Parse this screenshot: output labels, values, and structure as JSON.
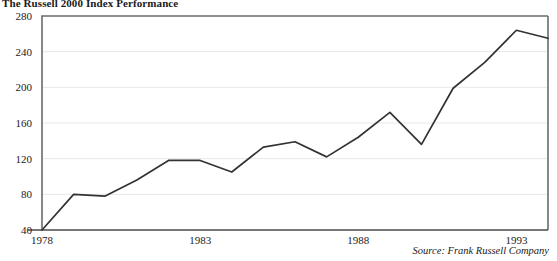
{
  "chart_data": {
    "type": "line",
    "title": "The Russell 2000 Index Performance",
    "subtitle": "",
    "xlabel": "",
    "ylabel": "",
    "source": "Source: Frank Russell Company",
    "grid": true,
    "legend": false,
    "legend_position": "none",
    "xlim": [
      1978,
      1994
    ],
    "ylim": [
      40,
      280
    ],
    "yticks": [
      40,
      80,
      120,
      160,
      200,
      240,
      280
    ],
    "ytick_labels": [
      "40",
      "80",
      "120",
      "160",
      "200",
      "240",
      "280"
    ],
    "xticks": [
      1978,
      1983,
      1988,
      1993
    ],
    "xtick_labels": [
      "1978",
      "1983",
      "1988",
      "1993"
    ],
    "x": [
      1978,
      1979,
      1980,
      1981,
      1982,
      1983,
      1984,
      1985,
      1986,
      1987,
      1988,
      1989,
      1990,
      1991,
      1992,
      1993,
      1994
    ],
    "values": [
      40,
      80,
      78,
      96,
      118,
      118,
      105,
      133,
      139,
      122,
      144,
      172,
      136,
      199,
      228,
      264,
      255
    ],
    "series": [
      {
        "name": "Russell 2000 Index",
        "color": "#333333",
        "values": [
          40,
          80,
          78,
          96,
          118,
          118,
          105,
          133,
          139,
          122,
          144,
          172,
          136,
          199,
          228,
          264,
          255
        ]
      }
    ]
  }
}
